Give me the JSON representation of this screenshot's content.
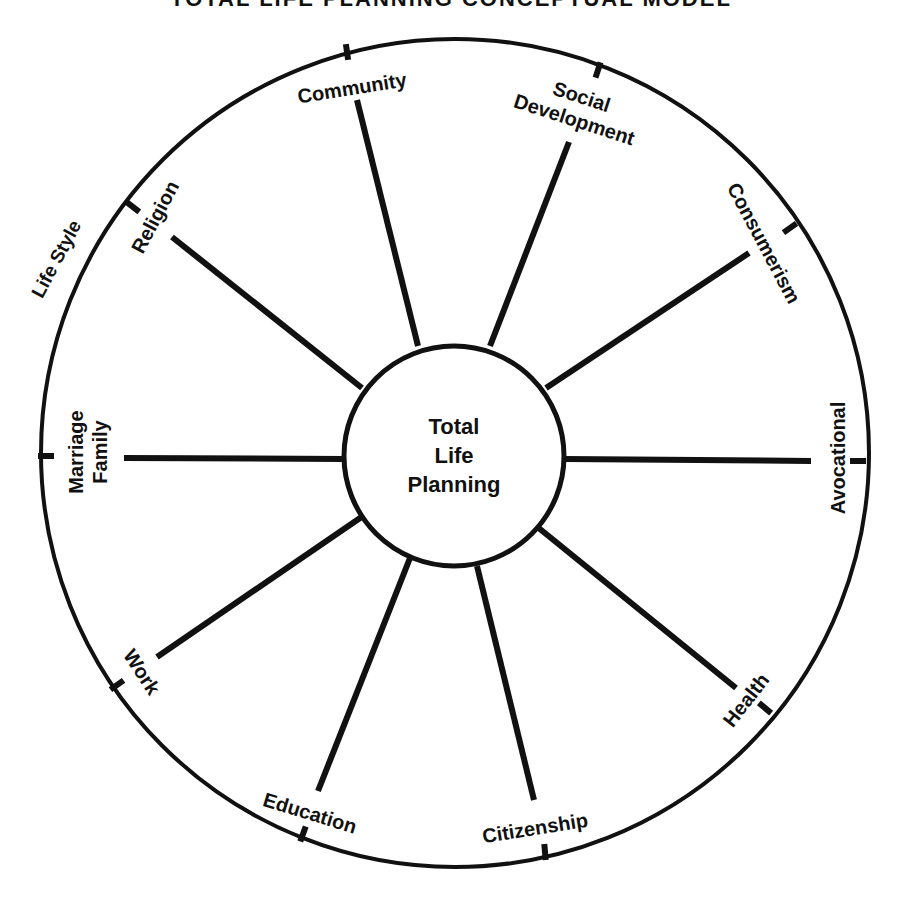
{
  "title": "TOTAL LIFE PLANNING CONCEPTUAL MODEL",
  "colors": {
    "ink": "#111111",
    "paper": "#ffffff"
  },
  "outer_circle": {
    "cx": 455,
    "cy": 453,
    "r": 414
  },
  "hub": {
    "cx": 454,
    "cy": 456,
    "r": 110,
    "lines": [
      "Total",
      "Life",
      "Planning"
    ]
  },
  "outer_label": {
    "text": "Life Style",
    "x": 62,
    "y": 262,
    "rotate": -62
  },
  "spokes": [
    {
      "name": "Community",
      "from": [
        418,
        346
      ],
      "to": [
        357,
        100
      ],
      "tick": [
        347,
        52,
        -8
      ],
      "label": {
        "x": 352,
        "y": 88,
        "rotate": -9,
        "lines": [
          "Community"
        ]
      }
    },
    {
      "name": "Social Development",
      "from": [
        490,
        346
      ],
      "to": [
        569,
        142
      ],
      "tick": [
        598,
        70,
        18
      ],
      "label": {
        "x": 578,
        "y": 108,
        "rotate": 18,
        "lines": [
          "Social",
          "Development"
        ]
      }
    },
    {
      "name": "Consumerism",
      "from": [
        546,
        388
      ],
      "to": [
        749,
        253
      ],
      "tick": [
        790,
        228,
        55
      ],
      "label": {
        "x": 764,
        "y": 243,
        "rotate": 62,
        "lines": [
          "Consumerism"
        ]
      }
    },
    {
      "name": "Avocational",
      "from": [
        565,
        459
      ],
      "to": [
        811,
        461
      ],
      "tick": [
        858,
        461,
        90
      ],
      "label": {
        "x": 838,
        "y": 458,
        "rotate": -90,
        "lines": [
          "Avocational"
        ]
      }
    },
    {
      "name": "Health",
      "from": [
        535,
        525
      ],
      "to": [
        736,
        688
      ],
      "tick": [
        765,
        708,
        130
      ],
      "label": {
        "x": 746,
        "y": 700,
        "rotate": -52,
        "lines": [
          "Health"
        ]
      }
    },
    {
      "name": "Citizenship",
      "from": [
        477,
        566
      ],
      "to": [
        534,
        800
      ],
      "tick": [
        545,
        852,
        175
      ],
      "label": {
        "x": 535,
        "y": 828,
        "rotate": -9,
        "lines": [
          "Citizenship"
        ]
      }
    },
    {
      "name": "Education",
      "from": [
        410,
        558
      ],
      "to": [
        318,
        791
      ],
      "tick": [
        303,
        834,
        200
      ],
      "label": {
        "x": 310,
        "y": 813,
        "rotate": 17,
        "lines": [
          "Education"
        ]
      }
    },
    {
      "name": "Work",
      "from": [
        363,
        516
      ],
      "to": [
        157,
        657
      ],
      "tick": [
        117,
        685,
        235
      ],
      "label": {
        "x": 142,
        "y": 672,
        "rotate": 57,
        "lines": [
          "Work"
        ]
      }
    },
    {
      "name": "Marriage Family",
      "from": [
        343,
        459
      ],
      "to": [
        124,
        458
      ],
      "tick": [
        46,
        456,
        270
      ],
      "label": {
        "x": 88,
        "y": 452,
        "rotate": -90,
        "lines": [
          "Marriage",
          "Family"
        ]
      }
    },
    {
      "name": "Religion",
      "from": [
        362,
        388
      ],
      "to": [
        172,
        237
      ],
      "tick": [
        133,
        207,
        308
      ],
      "label": {
        "x": 155,
        "y": 217,
        "rotate": -62,
        "lines": [
          "Religion"
        ]
      }
    }
  ]
}
